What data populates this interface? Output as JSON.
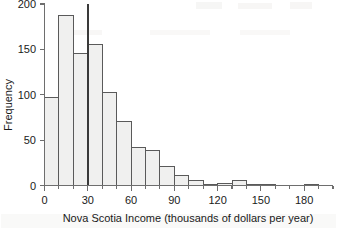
{
  "chart_data": {
    "type": "bar",
    "title": "",
    "subtitle": "",
    "xlabel": "Nova Scotia Income (thousands of dollars per year)",
    "ylabel": "Frequency",
    "xlim": [
      0,
      200
    ],
    "ylim": [
      0,
      200
    ],
    "xticks": [
      0,
      30,
      60,
      90,
      120,
      150,
      180
    ],
    "xtick_labels": [
      "0",
      "30",
      "60",
      "90",
      "120",
      "150",
      "180"
    ],
    "yticks": [
      0,
      50,
      100,
      150,
      200
    ],
    "ytick_labels": [
      "0",
      "50",
      "100",
      "150",
      "200"
    ],
    "grid": false,
    "legend": null,
    "bin_width": 10,
    "bin_edges": [
      0,
      10,
      20,
      30,
      40,
      50,
      60,
      70,
      80,
      90,
      100,
      110,
      120,
      130,
      140,
      150,
      160,
      170,
      180,
      190,
      200
    ],
    "categories": [
      "0-10",
      "10-20",
      "20-30",
      "30-40",
      "40-50",
      "50-60",
      "60-70",
      "70-80",
      "80-90",
      "90-100",
      "100-110",
      "110-120",
      "120-130",
      "130-140",
      "140-150",
      "150-160",
      "160-170",
      "170-180",
      "180-190",
      "190-200"
    ],
    "values": [
      97,
      187,
      145,
      155,
      102,
      71,
      42,
      39,
      21,
      11,
      5,
      1,
      2,
      5,
      1,
      1,
      0,
      0,
      1,
      0
    ],
    "annotations": [
      {
        "name": "reference-line",
        "type": "vline",
        "x": 30,
        "y_top": 200,
        "y_bottom": 0,
        "color": "#3a3a3a"
      }
    ]
  },
  "axes": {
    "x_title": "Nova Scotia Income (thousands of dollars per year)",
    "y_title": "Frequency"
  },
  "colors": {
    "bar_fill": "#f0f0ef",
    "bar_stroke": "#5a5a5a",
    "axis": "#6e6e6e",
    "reference_line": "#3a3a3a",
    "text": "#1a1a1a",
    "background": "#ffffff"
  }
}
